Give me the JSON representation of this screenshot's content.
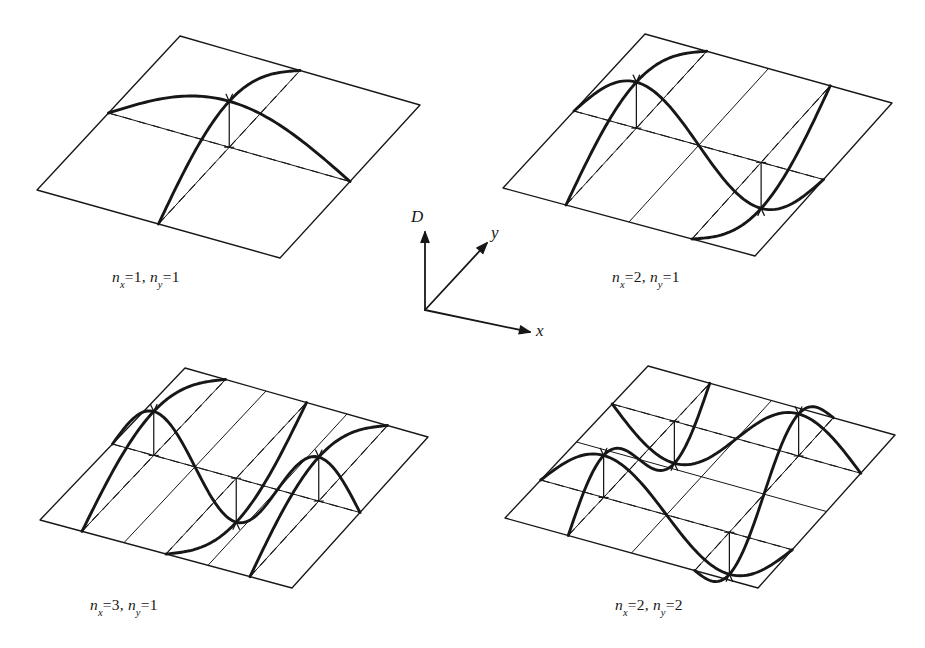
{
  "figure": {
    "kind": "mode-shape-diagram",
    "background_color": "#ffffff",
    "ink_color": "#171717",
    "panel_count": 4
  },
  "axes_triad": {
    "name": "axis-triad",
    "origin": {
      "x": 425,
      "y": 310
    },
    "arrows": [
      {
        "label": "D",
        "name": "axis-d",
        "tip": {
          "x": 425,
          "y": 232
        },
        "meaning": "displacement"
      },
      {
        "label": "y",
        "name": "axis-y",
        "tip": {
          "x": 487,
          "y": 243
        },
        "meaning": "in-plane y"
      },
      {
        "label": "x",
        "name": "axis-x",
        "tip": {
          "x": 530,
          "y": 332
        },
        "meaning": "in-plane x"
      }
    ],
    "label_d": "D",
    "label_y": "y",
    "label_x": "x"
  },
  "panels": [
    {
      "id": "panel-1",
      "nx": 1,
      "ny": 1,
      "caption_prefix_n": "n",
      "caption_sub_x": "x",
      "caption_sub_y": "y",
      "caption_eq": "=",
      "caption_sep": ", ",
      "caption_nx_value": "1",
      "caption_ny_value": "1",
      "caption_text": "nx = 1, ny = 1",
      "caption_pos": {
        "x": 112,
        "y": 268
      },
      "x_divisions": 2,
      "y_divisions": 2,
      "quad": {
        "top": [
          180,
          36
        ],
        "right": [
          420,
          105
        ],
        "bottom": [
          280,
          258
        ],
        "left": [
          37,
          190
        ]
      },
      "amplitude": 46,
      "antinodes": [
        {
          "u": 0.5,
          "v": 0.5,
          "sign": 1
        }
      ]
    },
    {
      "id": "panel-2",
      "nx": 2,
      "ny": 1,
      "caption_prefix_n": "n",
      "caption_sub_x": "x",
      "caption_sub_y": "y",
      "caption_eq": "=",
      "caption_sep": ", ",
      "caption_nx_value": "2",
      "caption_ny_value": "1",
      "caption_text": "nx = 2, ny = 1",
      "caption_pos": {
        "x": 612,
        "y": 268
      },
      "x_divisions": 4,
      "y_divisions": 2,
      "quad": {
        "top": [
          645,
          34
        ],
        "right": [
          892,
          103
        ],
        "bottom": [
          755,
          256
        ],
        "left": [
          503,
          188
        ]
      },
      "amplitude": 46,
      "antinodes": [
        {
          "u": 0.25,
          "v": 0.5,
          "sign": -1
        },
        {
          "u": 0.75,
          "v": 0.5,
          "sign": 1
        }
      ]
    },
    {
      "id": "panel-3",
      "nx": 3,
      "ny": 1,
      "caption_prefix_n": "n",
      "caption_sub_x": "x",
      "caption_sub_y": "y",
      "caption_eq": "=",
      "caption_sep": ", ",
      "caption_nx_value": "3",
      "caption_ny_value": "1",
      "caption_text": "nx = 3, ny = 1",
      "caption_pos": {
        "x": 90,
        "y": 596
      },
      "x_divisions": 6,
      "y_divisions": 2,
      "quad": {
        "top": [
          185,
          368
        ],
        "right": [
          428,
          437
        ],
        "bottom": [
          292,
          588
        ],
        "left": [
          40,
          520
        ]
      },
      "amplitude": 44,
      "antinodes": [
        {
          "u": 0.1667,
          "v": 0.5,
          "sign": 1
        },
        {
          "u": 0.5,
          "v": 0.5,
          "sign": -1
        },
        {
          "u": 0.8333,
          "v": 0.5,
          "sign": 1
        }
      ]
    },
    {
      "id": "panel-4",
      "nx": 2,
      "ny": 2,
      "caption_prefix_n": "n",
      "caption_sub_x": "x",
      "caption_sub_y": "y",
      "caption_eq": "=",
      "caption_sep": ", ",
      "caption_nx_value": "2",
      "caption_ny_value": "2",
      "caption_text": "nx = 2, ny = 2",
      "caption_pos": {
        "x": 615,
        "y": 596
      },
      "x_divisions": 4,
      "y_divisions": 4,
      "quad": {
        "top": [
          648,
          366
        ],
        "right": [
          895,
          435
        ],
        "bottom": [
          758,
          588
        ],
        "left": [
          505,
          518
        ]
      },
      "amplitude": 42,
      "antinodes": [
        {
          "u": 0.25,
          "v": 0.25,
          "sign": 1
        },
        {
          "u": 0.75,
          "v": 0.25,
          "sign": -1
        },
        {
          "u": 0.25,
          "v": 0.75,
          "sign": -1
        },
        {
          "u": 0.75,
          "v": 0.75,
          "sign": 1
        }
      ]
    }
  ],
  "chart_data": {
    "type": "line",
    "title": "",
    "xlabel": "x",
    "ylabel": "y",
    "zlabel": "D",
    "series": [
      {
        "name": "nx=1, ny=1",
        "nx": 1,
        "ny": 1,
        "antinode_count": 1
      },
      {
        "name": "nx=2, ny=1",
        "nx": 2,
        "ny": 1,
        "antinode_count": 2
      },
      {
        "name": "nx=3, ny=1",
        "nx": 3,
        "ny": 1,
        "antinode_count": 3
      },
      {
        "name": "nx=2, ny=2",
        "nx": 2,
        "ny": 2,
        "antinode_count": 4
      }
    ]
  }
}
